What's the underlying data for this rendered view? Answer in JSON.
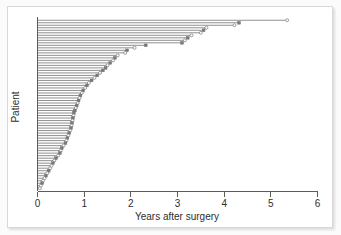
{
  "figure": {
    "background": "#ffffff",
    "frame_color": "#d8d8d8"
  },
  "chart_data": {
    "type": "bar",
    "orientation": "horizontal",
    "title": "",
    "subtitle": "",
    "xlabel": "Years after surgery",
    "ylabel": "Patient",
    "xlim": [
      0,
      6
    ],
    "ylim": [
      0,
      69
    ],
    "xticks": [
      0,
      1,
      2,
      3,
      4,
      5,
      6
    ],
    "xtick_labels": [
      "0",
      "1",
      "2",
      "3",
      "4",
      "5",
      "6"
    ],
    "yticks": [],
    "ytick_labels": [],
    "grid": false,
    "legend": null,
    "series_color": "#6b6b6b",
    "marker_open_label": "censored",
    "marker_solid_label": "event",
    "categories": [
      "P1",
      "P2",
      "P3",
      "P4",
      "P5",
      "P6",
      "P7",
      "P8",
      "P9",
      "P10",
      "P11",
      "P12",
      "P13",
      "P14",
      "P15",
      "P16",
      "P17",
      "P18",
      "P19",
      "P20",
      "P21",
      "P22",
      "P23",
      "P24",
      "P25",
      "P26",
      "P27",
      "P28",
      "P29",
      "P30",
      "P31",
      "P32",
      "P33",
      "P34",
      "P35",
      "P36",
      "P37",
      "P38",
      "P39",
      "P40",
      "P41",
      "P42",
      "P43",
      "P44",
      "P45",
      "P46",
      "P47",
      "P48",
      "P49",
      "P50",
      "P51",
      "P52",
      "P53",
      "P54",
      "P55",
      "P56",
      "P57",
      "P58",
      "P59",
      "P60",
      "P61",
      "P62",
      "P63",
      "P64",
      "P65",
      "P66",
      "P67",
      "P68"
    ],
    "values": [
      5.35,
      4.32,
      4.22,
      3.62,
      3.56,
      3.5,
      3.3,
      3.22,
      3.16,
      3.1,
      2.32,
      2.08,
      1.92,
      1.88,
      1.72,
      1.66,
      1.62,
      1.56,
      1.5,
      1.46,
      1.4,
      1.34,
      1.28,
      1.22,
      1.16,
      1.1,
      1.06,
      1.02,
      0.98,
      0.95,
      0.92,
      0.9,
      0.88,
      0.86,
      0.84,
      0.82,
      0.8,
      0.78,
      0.77,
      0.76,
      0.75,
      0.74,
      0.73,
      0.72,
      0.7,
      0.68,
      0.66,
      0.64,
      0.62,
      0.6,
      0.56,
      0.52,
      0.5,
      0.48,
      0.44,
      0.4,
      0.36,
      0.33,
      0.3,
      0.27,
      0.24,
      0.21,
      0.18,
      0.15,
      0.12,
      0.1,
      0.07,
      0.05
    ],
    "markers": [
      "open",
      "solid",
      "open",
      "open",
      "solid",
      "open",
      "open",
      "solid",
      "open",
      "solid",
      "solid",
      "open",
      "solid",
      "open",
      "open",
      "solid",
      "open",
      "solid",
      "open",
      "solid",
      "solid",
      "open",
      "solid",
      "open",
      "solid",
      "open",
      "solid",
      "open",
      "solid",
      "open",
      "solid",
      "open",
      "solid",
      "open",
      "solid",
      "open",
      "solid",
      "solid",
      "open",
      "solid",
      "open",
      "solid",
      "open",
      "solid",
      "open",
      "solid",
      "open",
      "solid",
      "open",
      "solid",
      "open",
      "solid",
      "open",
      "solid",
      "open",
      "solid",
      "open",
      "solid",
      "open",
      "open",
      "solid",
      "open",
      "solid",
      "open",
      "open",
      "solid",
      "open",
      "open"
    ]
  }
}
